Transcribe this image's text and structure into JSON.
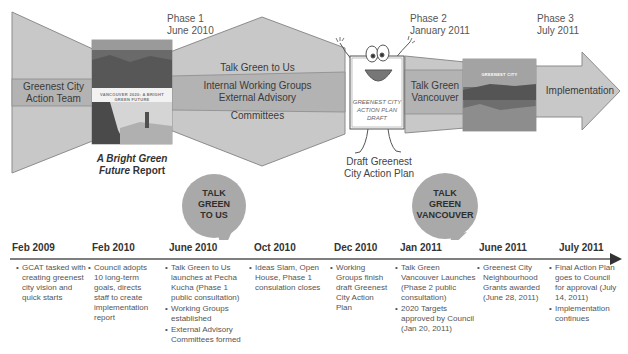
{
  "banner": {
    "phases": [
      {
        "label": "Phase 1",
        "date": "June 2010"
      },
      {
        "label": "Phase 2",
        "date": "January 2011"
      },
      {
        "label": "Phase 3",
        "date": "July 2011"
      }
    ],
    "stage1": {
      "label_line1": "Greenest City",
      "label_line2": "Action Team"
    },
    "stage2": {
      "top_label": "Talk Green to Us",
      "band_line1": "Internal Working Groups",
      "band_line2": "External Advisory",
      "bottom_label": "Committees"
    },
    "stage3": {
      "label_line1": "Talk Green",
      "label_line2": "Vancouver"
    },
    "stage4": {
      "label": "Implementation"
    },
    "report_caption": {
      "italic": "A Bright Green",
      "italic2": "Future",
      "rest": " Report"
    },
    "report_cover_title": "VANCOUVER 2020: A BRIGHT GREEN FUTURE",
    "vancouver_cover_title": "GREENEST CITY",
    "mascot": {
      "sign_line1": "GREENEST CITY",
      "sign_line2": "ACTION PLAN",
      "sign_line3": "DRAFT",
      "caption_line1": "Draft Greenest",
      "caption_line2": "City Action Plan"
    }
  },
  "bubbles": [
    {
      "lines": [
        "TALK",
        "GREEN",
        "TO US"
      ]
    },
    {
      "lines": [
        "TALK",
        "GREEN",
        "VANCOUVER"
      ]
    }
  ],
  "timeline": [
    {
      "date": "Feb 2009",
      "items": [
        "GCAT tasked with creating greenest city vision and quick starts"
      ]
    },
    {
      "date": "Feb 2010",
      "items": [
        "Council adopts 10 long-term goals, directs staff to create implementation report"
      ]
    },
    {
      "date": "June 2010",
      "items": [
        "Talk Green to Us launches at Pecha Kucha (Phase 1 public consultation)",
        "Working Groups established",
        "External Advisory Committees formed"
      ]
    },
    {
      "date": "Oct 2010",
      "items": [
        "Ideas Slam, Open House, Phase 1 consulation closes"
      ]
    },
    {
      "date": "Dec 2010",
      "items": [
        "Working Groups finish draft Greenest City Action Plan"
      ]
    },
    {
      "date": "Jan 2011",
      "items": [
        "Talk Green Vancouver Launches (Phase 2 public consultation)",
        "2020 Targets approved by Council (Jan 20, 2011)"
      ]
    },
    {
      "date": "June 2011",
      "items": [
        "Greenest City Neighbourhood Grants awarded (June 28, 2011)"
      ]
    },
    {
      "date": "July 2011",
      "items": [
        "Final Action Plan goes to Council for approval (July 14, 2011)",
        "Implementation continues"
      ]
    }
  ],
  "colors": {
    "shape_fill": "#c8c8c8",
    "band_fill": "#b3b3b3",
    "shape_stroke": "#8c8c8c",
    "bubble_fill": "#a9a9a9",
    "timeline_line": "#555555"
  }
}
